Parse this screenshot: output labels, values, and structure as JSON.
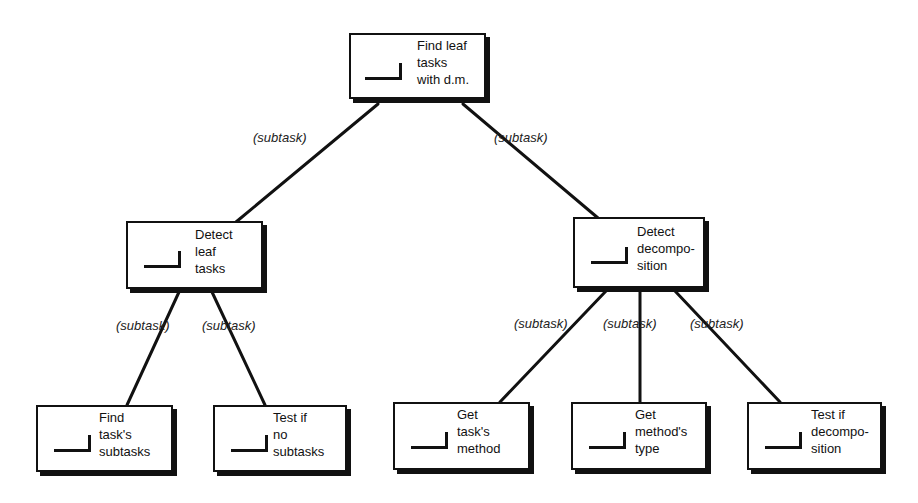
{
  "diagram": {
    "type": "task-decomposition-tree",
    "nodes": [
      {
        "id": "root",
        "label": "Find leaf\ntasks\nwith d.m."
      },
      {
        "id": "detect-leaf",
        "label": "Detect\nleaf\ntasks"
      },
      {
        "id": "detect-decomp",
        "label": "Detect\ndecompo-\nsition"
      },
      {
        "id": "find-subtasks",
        "label": "Find\ntask's\nsubtasks"
      },
      {
        "id": "test-no-subtasks",
        "label": "Test if\nno\nsubtasks"
      },
      {
        "id": "get-method",
        "label": "Get\ntask's\nmethod"
      },
      {
        "id": "get-method-type",
        "label": "Get\nmethod's\ntype"
      },
      {
        "id": "test-decomp",
        "label": "Test if\ndecompo-\nsition"
      }
    ],
    "edges": [
      {
        "from": "root",
        "to": "detect-leaf",
        "label": "(subtask)"
      },
      {
        "from": "root",
        "to": "detect-decomp",
        "label": "(subtask)"
      },
      {
        "from": "detect-leaf",
        "to": "find-subtasks",
        "label": "(subtask)"
      },
      {
        "from": "detect-leaf",
        "to": "test-no-subtasks",
        "label": "(subtask)"
      },
      {
        "from": "detect-decomp",
        "to": "get-method",
        "label": "(subtask)"
      },
      {
        "from": "detect-decomp",
        "to": "get-method-type",
        "label": "(subtask)"
      },
      {
        "from": "detect-decomp",
        "to": "test-decomp",
        "label": "(subtask)"
      }
    ]
  }
}
